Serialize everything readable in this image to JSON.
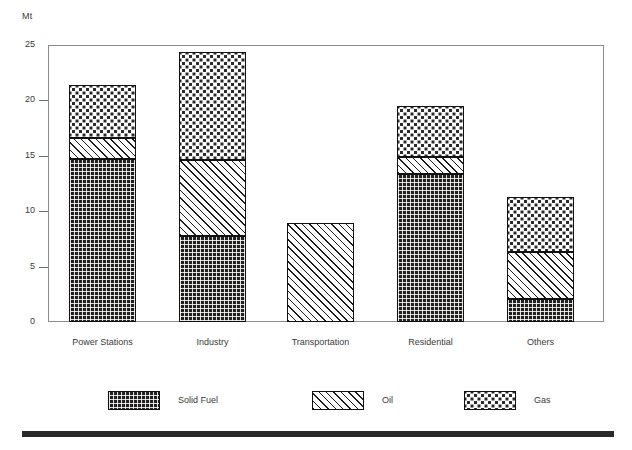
{
  "chart_data": {
    "type": "bar",
    "subtype": "stacked-vertical",
    "title": "",
    "xlabel": "",
    "ylabel": "Mt",
    "unit_label": "Mt",
    "ylim": [
      0,
      25
    ],
    "yticks": [
      0,
      5,
      10,
      15,
      20,
      25
    ],
    "ytick_labels": [
      "0",
      "5",
      "10",
      "15",
      "20",
      "25"
    ],
    "grid": false,
    "legend_position": "bottom",
    "categories": [
      "Power Stations",
      "Industry",
      "Transportation",
      "Residential",
      "Others"
    ],
    "series": [
      {
        "name": "Solid Fuel",
        "pattern": "dense-brick",
        "values": [
          14.7,
          7.8,
          0.0,
          13.4,
          2.1
        ]
      },
      {
        "name": "Oil",
        "pattern": "diagonal-hatch",
        "values": [
          1.9,
          6.8,
          8.9,
          1.5,
          4.2
        ]
      },
      {
        "name": "Gas",
        "pattern": "sparse-dots",
        "values": [
          4.8,
          9.8,
          0.0,
          4.6,
          5.0
        ]
      }
    ],
    "totals": [
      21.4,
      24.4,
      8.9,
      19.5,
      11.3
    ]
  },
  "axis": {
    "unit": "Mt",
    "ticks": [
      {
        "value": 25,
        "label": "25",
        "has_mark": false
      },
      {
        "value": 20,
        "label": "20",
        "has_mark": true
      },
      {
        "value": 15,
        "label": "15",
        "has_mark": true
      },
      {
        "value": 10,
        "label": "10",
        "has_mark": true
      },
      {
        "value": 5,
        "label": "5",
        "has_mark": true
      },
      {
        "value": 0,
        "label": "0",
        "has_mark": false
      }
    ]
  },
  "legend": {
    "items": [
      {
        "label": "Solid Fuel",
        "pattern": "dense-brick"
      },
      {
        "label": "Oil",
        "pattern": "diagonal-hatch"
      },
      {
        "label": "Gas",
        "pattern": "sparse-dots"
      }
    ]
  }
}
